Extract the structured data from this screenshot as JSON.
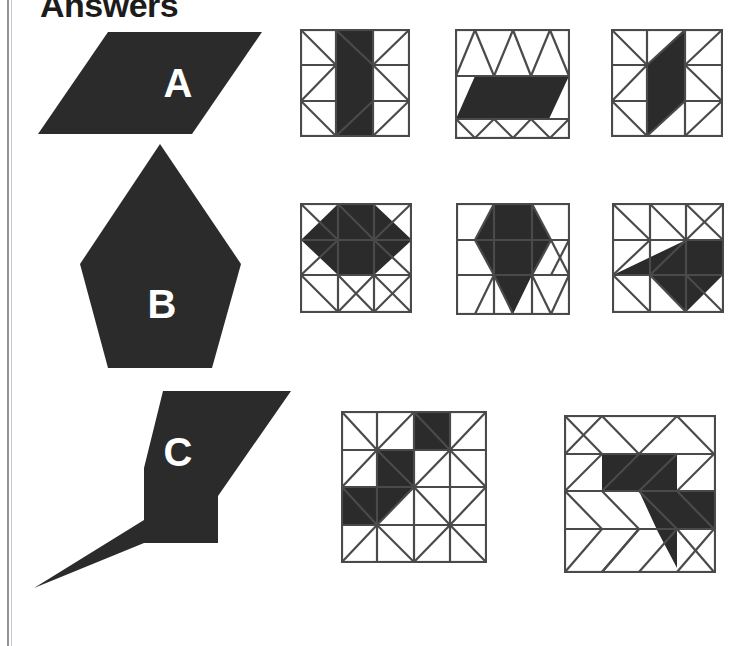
{
  "page": {
    "title": "Answers",
    "ink_color": "#2b2b2b",
    "line_color": "#4a4a4a",
    "background_color": "#ffffff",
    "frame_color": "#8f9296",
    "label_color": "#ffffff",
    "width": 756,
    "height": 646
  },
  "rows": [
    {
      "id": "row-a",
      "label": "A",
      "prompt_shape": "parallelogram",
      "answers": [
        {
          "id": "a-1",
          "name": "answer-grid-a-1",
          "grid": "triangular-4x3-vertical"
        },
        {
          "id": "a-2",
          "name": "answer-grid-a-2",
          "grid": "triangular-4x3-horizontal"
        },
        {
          "id": "a-3",
          "name": "answer-grid-a-3",
          "grid": "triangular-4x3-vertical"
        }
      ]
    },
    {
      "id": "row-b",
      "label": "B",
      "prompt_shape": "pentagon-kite",
      "answers": [
        {
          "id": "b-1",
          "name": "answer-grid-b-1",
          "grid": "triangular-4x3-vertical"
        },
        {
          "id": "b-2",
          "name": "answer-grid-b-2",
          "grid": "triangular-4x3-vertical"
        },
        {
          "id": "b-3",
          "name": "answer-grid-b-3",
          "grid": "triangular-4x3-vertical"
        }
      ]
    },
    {
      "id": "row-c",
      "label": "C",
      "prompt_shape": "zigzag-z-shape",
      "answers": [
        {
          "id": "c-1",
          "name": "answer-grid-c-1",
          "grid": "triangular-4x4-vertical"
        },
        {
          "id": "c-2",
          "name": "answer-grid-c-2",
          "grid": "triangular-4x4-vertical"
        }
      ]
    }
  ]
}
